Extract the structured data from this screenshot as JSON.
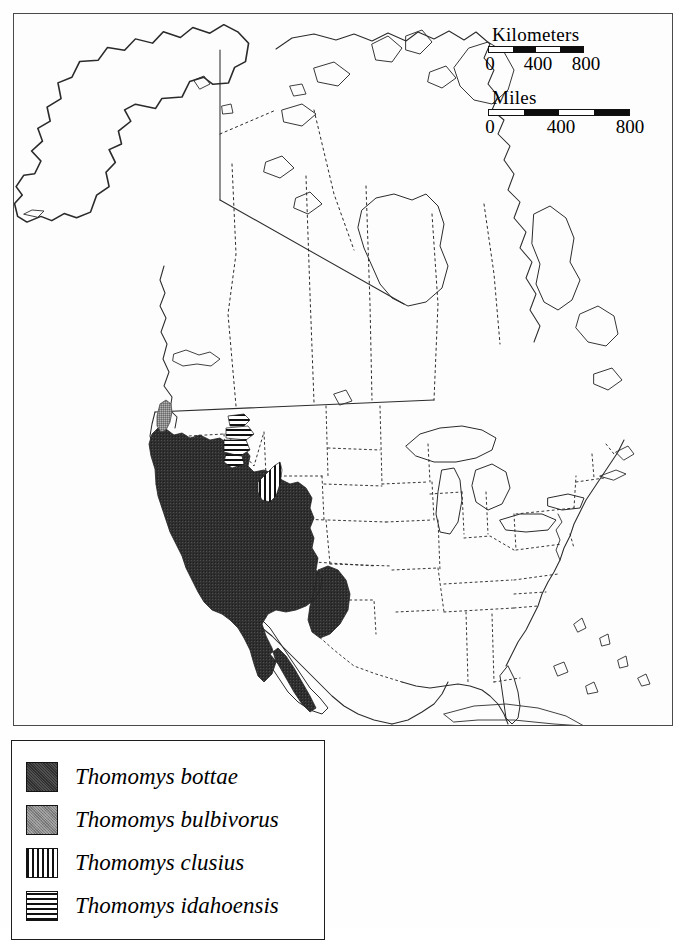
{
  "figure": {
    "type": "species-distribution-map",
    "region": "North America",
    "background_color": "#ffffff",
    "frame_color": "#4a4a4a"
  },
  "scale": {
    "kilometers": {
      "title": "Kilometers",
      "ticks": [
        "0",
        "400",
        "800"
      ],
      "segments": [
        "light",
        "dark",
        "light",
        "dark"
      ]
    },
    "miles": {
      "title": "Miles",
      "ticks": [
        "0",
        "400",
        "800"
      ],
      "segments": [
        "light",
        "dark",
        "light",
        "dark"
      ]
    }
  },
  "legend": {
    "items": [
      {
        "label": "Thomomys bottae",
        "pattern": "solid-dark",
        "color": "#2f2f2f"
      },
      {
        "label": "Thomomys bulbivorus",
        "pattern": "solid-gray",
        "color": "#828282"
      },
      {
        "label": "Thomomys clusius",
        "pattern": "vert-hatch",
        "color": "#111111"
      },
      {
        "label": "Thomomys idahoensis",
        "pattern": "horiz-hatch",
        "color": "#111111"
      }
    ]
  },
  "map_features": {
    "coastline_color": "#2b2b2b",
    "internal_border_style": "dotted",
    "ranges": [
      {
        "species": "Thomomys bottae",
        "area": "western United States and Baja California"
      },
      {
        "species": "Thomomys bulbivorus",
        "area": "Willamette Valley, Oregon"
      },
      {
        "species": "Thomomys clusius",
        "area": "south-central Wyoming"
      },
      {
        "species": "Thomomys idahoensis",
        "area": "eastern Idaho / southwest Montana"
      }
    ]
  }
}
